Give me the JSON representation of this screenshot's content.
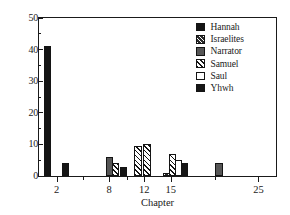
{
  "chart_data": {
    "type": "bar",
    "title": "",
    "xlabel": "Chapter",
    "ylabel": "",
    "xlim": [
      0,
      27
    ],
    "ylim": [
      0,
      50
    ],
    "grid": false,
    "legend_position": "top-right",
    "y_ticks_major": [
      0,
      10,
      20,
      30,
      40,
      50
    ],
    "y_ticks_minor": [
      5,
      15,
      25,
      35,
      45
    ],
    "x_ticks_major": [
      2,
      8,
      12,
      15,
      25
    ],
    "x_ticks_minor": [
      5,
      10,
      20
    ],
    "x_tick_labels": [
      "2",
      "8",
      "12",
      "15",
      "25"
    ],
    "series": [
      {
        "name": "Hannah",
        "fill": "solid-black",
        "points": [
          {
            "chapter": 1,
            "value": 41
          }
        ]
      },
      {
        "name": "Israelites",
        "fill": "dark-hatch",
        "points": [
          {
            "chapter": 15,
            "value": 1
          }
        ]
      },
      {
        "name": "Narrator",
        "fill": "gray-solid",
        "points": [
          {
            "chapter": 8,
            "value": 6
          },
          {
            "chapter": 25,
            "value": 4
          }
        ]
      },
      {
        "name": "Samuel",
        "fill": "white-hatch",
        "points": [
          {
            "chapter": 8,
            "value": 4
          },
          {
            "chapter": 11,
            "value": 9.5
          },
          {
            "chapter": 12,
            "value": 10
          },
          {
            "chapter": 15,
            "value": 7
          }
        ]
      },
      {
        "name": "Saul",
        "fill": "white",
        "points": [
          {
            "chapter": 15,
            "value": 5
          }
        ]
      },
      {
        "name": "Yhwh",
        "fill": "black2",
        "points": [
          {
            "chapter": 3,
            "value": 4
          },
          {
            "chapter": 9,
            "value": 3
          },
          {
            "chapter": 16,
            "value": 4
          }
        ]
      }
    ],
    "bars": [
      {
        "series": "Hannah",
        "fill": "solid-black",
        "x": 1,
        "value": 41
      },
      {
        "series": "Yhwh",
        "fill": "black2",
        "x": 3,
        "value": 4
      },
      {
        "series": "Narrator",
        "fill": "gray-solid",
        "x": 8,
        "value": 6
      },
      {
        "series": "Samuel",
        "fill": "white-hatch",
        "x": 8.7,
        "value": 4
      },
      {
        "series": "Yhwh",
        "fill": "black2",
        "x": 9.6,
        "value": 3
      },
      {
        "series": "Samuel",
        "fill": "white-hatch",
        "x": 11.3,
        "value": 9.5
      },
      {
        "series": "Samuel",
        "fill": "white-hatch",
        "x": 12.3,
        "value": 10
      },
      {
        "series": "Israelites",
        "fill": "dark-hatch",
        "x": 14.6,
        "value": 1
      },
      {
        "series": "Samuel",
        "fill": "white-hatch",
        "x": 15.2,
        "value": 7
      },
      {
        "series": "Saul",
        "fill": "white",
        "x": 15.9,
        "value": 5
      },
      {
        "series": "Yhwh",
        "fill": "black2",
        "x": 16.6,
        "value": 4
      },
      {
        "series": "Narrator",
        "fill": "gray-solid",
        "x": 20.5,
        "value": 4
      }
    ]
  },
  "legend": {
    "entries": [
      {
        "label": "Hannah",
        "fill": "solid-black"
      },
      {
        "label": "Israelites",
        "fill": "dark-hatch"
      },
      {
        "label": "Narrator",
        "fill": "gray-solid"
      },
      {
        "label": "Samuel",
        "fill": "white-hatch"
      },
      {
        "label": "Saul",
        "fill": "white"
      },
      {
        "label": "Yhwh",
        "fill": "black2"
      }
    ]
  },
  "colors": {
    "axis": "#1a1a1a",
    "solid-black": "#141414",
    "dark-hatch": "#2b2b2b",
    "gray-solid": "#565656",
    "white-hatch": "#ffffff",
    "white": "#ffffff",
    "black2": "#161616",
    "background": "#ffffff"
  }
}
